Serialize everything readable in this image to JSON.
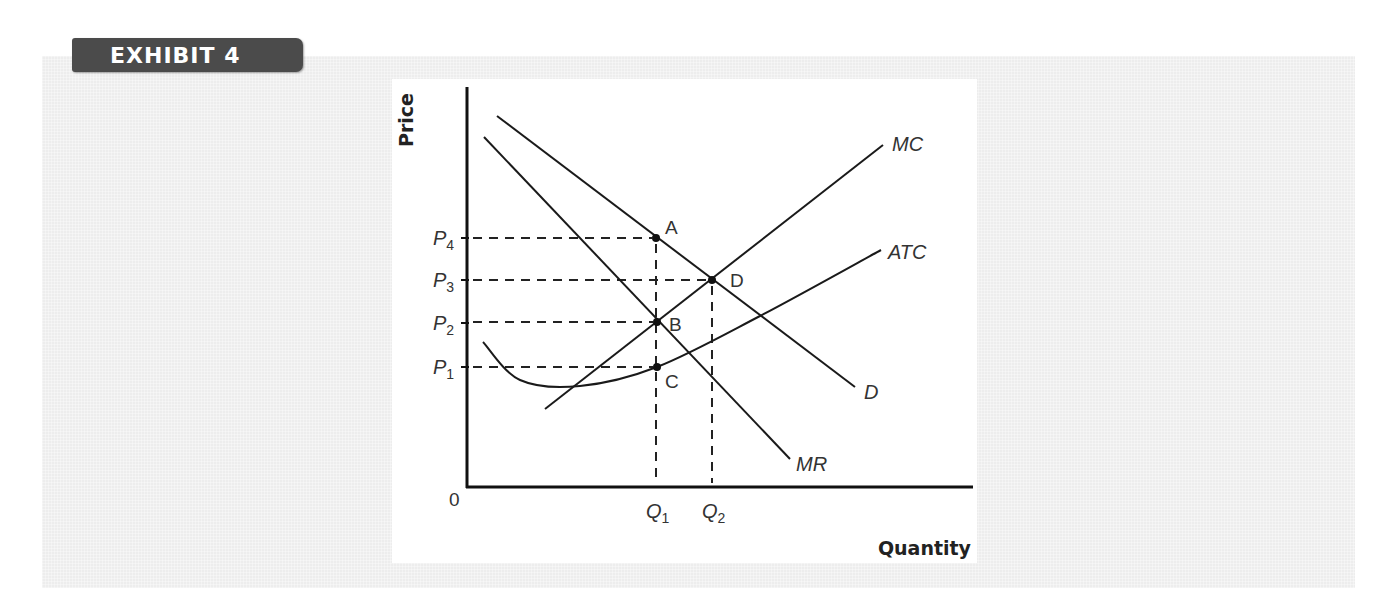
{
  "exhibit": {
    "label": "EXHIBIT 4"
  },
  "chart_data": {
    "type": "line",
    "title": "",
    "xlabel": "Quantity",
    "ylabel": "Price",
    "origin_label": "0",
    "grid": false,
    "legend": "none (curves labeled directly)",
    "x_ticks": [
      {
        "label": "Q",
        "sub": "1",
        "x": 657
      },
      {
        "label": "Q",
        "sub": "2",
        "x": 713
      }
    ],
    "y_ticks": [
      {
        "label": "P",
        "sub": "4",
        "y": 238
      },
      {
        "label": "P",
        "sub": "3",
        "y": 280
      },
      {
        "label": "P",
        "sub": "2",
        "y": 323
      },
      {
        "label": "P",
        "sub": "1",
        "y": 367
      }
    ],
    "series": [
      {
        "name": "D",
        "label": "D",
        "kind": "line",
        "points": [
          [
            497,
            116
          ],
          [
            855,
            387
          ]
        ],
        "label_pos": [
          864,
          399
        ]
      },
      {
        "name": "MR",
        "label": "MR",
        "kind": "line",
        "points": [
          [
            484,
            137
          ],
          [
            790,
            459
          ]
        ],
        "label_pos": [
          796,
          471
        ]
      },
      {
        "name": "MC",
        "label": "MC",
        "kind": "line",
        "points": [
          [
            545,
            409
          ],
          [
            883,
            145
          ]
        ],
        "label_pos": [
          892,
          151
        ]
      },
      {
        "name": "ATC",
        "label": "ATC",
        "kind": "curve",
        "points": [
          [
            483,
            342
          ],
          [
            520,
            380
          ],
          [
            580,
            386
          ],
          [
            657,
            367
          ],
          [
            760,
            316
          ],
          [
            881,
            250
          ]
        ],
        "label_pos": [
          888,
          259
        ]
      }
    ],
    "points": [
      {
        "label": "A",
        "x": 656,
        "y": 238,
        "label_dx": 9,
        "label_dy": -4
      },
      {
        "label": "D",
        "x": 712,
        "y": 280,
        "label_dx": 18,
        "label_dy": 7
      },
      {
        "label": "B",
        "x": 657,
        "y": 322,
        "label_dx": 12,
        "label_dy": 9
      },
      {
        "label": "C",
        "x": 657,
        "y": 367,
        "label_dx": 8,
        "label_dy": 21
      }
    ],
    "annotations": [
      "Profit-maximizing monopolist: MR = MC at B (Q1), price read from demand at A (P4)",
      "Dashed guide lines from P1..P4 to the curves and from Q1, Q2 down to the axis"
    ]
  }
}
